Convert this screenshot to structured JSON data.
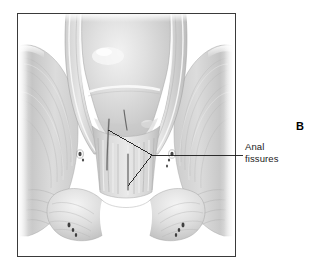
{
  "figure": {
    "panel_letter": "B",
    "frame": {
      "x": 17,
      "y": 13,
      "width": 219,
      "height": 244,
      "border_color": "#3a3a3a",
      "background": "#ffffff"
    }
  },
  "labels": {
    "anal_fissures": {
      "line1": "Anal",
      "line2": "fissures",
      "color": "#1a1a1a"
    }
  },
  "leader": {
    "color": "#1a1a1a",
    "vertex": {
      "x": 152,
      "y": 155
    },
    "branch_upper_end": {
      "x": 108,
      "y": 130
    },
    "branch_lower_end": {
      "x": 128,
      "y": 186
    },
    "horizontal_end": {
      "x": 243,
      "y": 155
    }
  },
  "palette": {
    "tissue_light": "#e8e8e8",
    "tissue_mid": "#cfcfcf",
    "tissue_dark": "#b0b0b0",
    "tissue_shadow": "#9a9a9a",
    "highlight": "#f7f7f7",
    "outline": "#8f8f8f",
    "fissure": "#5a5a5a",
    "vessel": "#3d3d3d",
    "background": "#ffffff"
  },
  "anatomy": {
    "parts": [
      "rectal-ampulla",
      "rectal-wall-left",
      "rectal-wall-right",
      "levator-ani-left",
      "levator-ani-right",
      "internal-sphincter",
      "external-sphincter",
      "anal-columns",
      "anal-fissure-upper",
      "anal-fissure-lower",
      "perianal-skin",
      "blood-vessels"
    ]
  }
}
